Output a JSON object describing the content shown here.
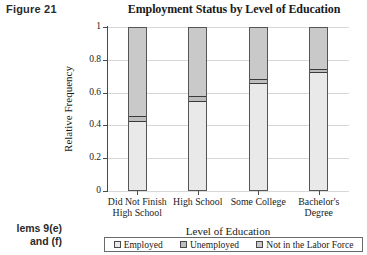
{
  "figure_label": "Figure 21",
  "margin_note_line1": "lems 9(e)",
  "margin_note_line2": "and (f)",
  "chart_data": {
    "type": "bar",
    "subtype": "stacked-100-percent",
    "title": "Employment Status by Level of Education",
    "xlabel": "Level of Education",
    "ylabel": "Relative Frequency",
    "ylim": [
      0,
      1
    ],
    "yticks": [
      0,
      0.2,
      0.4,
      0.6,
      0.8,
      1
    ],
    "ytick_labels": [
      "0",
      "0.2",
      "0.4",
      "0.6",
      "0.8",
      "1"
    ],
    "grid": true,
    "legend_position": "bottom",
    "categories": [
      "Did Not Finish High School",
      "High School",
      "Some College",
      "Bachelor's Degree"
    ],
    "category_label_lines": [
      [
        "Did Not Finish",
        "High School"
      ],
      [
        "High School",
        ""
      ],
      [
        "Some College",
        ""
      ],
      [
        "Bachelor's",
        "Degree"
      ]
    ],
    "series": [
      {
        "name": "Employed",
        "color": "#e9e9e9",
        "values": [
          0.42,
          0.545,
          0.655,
          0.72
        ]
      },
      {
        "name": "Unemployed",
        "color": "#bdbdbd",
        "values": [
          0.035,
          0.035,
          0.03,
          0.025
        ]
      },
      {
        "name": "Not in the Labor Force",
        "color": "#c9c9c9",
        "values": [
          0.545,
          0.42,
          0.315,
          0.255
        ]
      }
    ]
  },
  "legend": {
    "items": [
      {
        "label": "Employed"
      },
      {
        "label": "Unemployed"
      },
      {
        "label": "Not in the Labor Force"
      }
    ]
  }
}
